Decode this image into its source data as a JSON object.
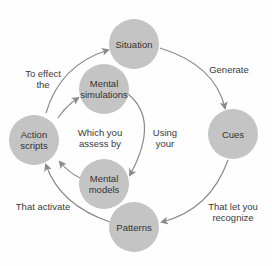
{
  "nodes": {
    "situation": "Situation",
    "cues": "Cues",
    "patterns": "Patterns",
    "action_scripts": "Action\nscripts",
    "mental_simulations": "Mental\nsimulations",
    "mental_models": "Mental\nmodels"
  },
  "edges": {
    "situation_to_cues": "Generate",
    "cues_to_patterns": "That let you\nrecognize",
    "patterns_to_action": "That activate",
    "action_to_situation": "To effect\nthe",
    "action_to_simulations": "Which you\nassess by",
    "simulations_to_models": "Using\nyour"
  },
  "colors": {
    "node_fill": "#c4c4c4",
    "arrow": "#8a8a8a",
    "text": "#333333"
  }
}
